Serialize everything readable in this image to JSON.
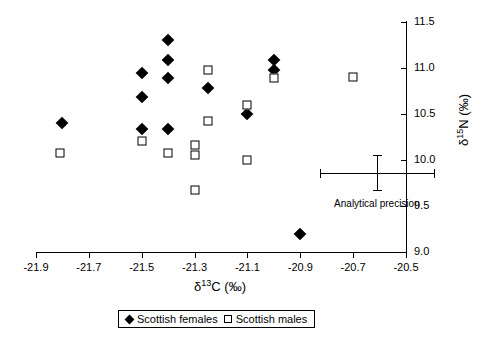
{
  "chart_data": {
    "type": "scatter",
    "title": "",
    "xlabel": "δ¹³C (‰)",
    "ylabel": "δ¹⁵N (‰)",
    "xlabel_parts": {
      "delta": "δ",
      "sup": "13",
      "rest": "C (‰)"
    },
    "ylabel_parts": {
      "delta": "δ",
      "sup": "15",
      "rest": "N (‰)"
    },
    "xlim": [
      -21.9,
      -20.5
    ],
    "ylim": [
      9.0,
      11.5
    ],
    "xticks": [
      -21.9,
      -21.7,
      -21.5,
      -21.3,
      -21.1,
      -20.9,
      -20.7,
      -20.5
    ],
    "yticks": [
      9.0,
      9.5,
      10.0,
      10.5,
      11.0,
      11.5
    ],
    "xtick_labels": [
      "-21.9",
      "-21.7",
      "-21.5",
      "-21.3",
      "-21.1",
      "-20.9",
      "-20.7",
      "-20.5"
    ],
    "ytick_labels": [
      "9.0",
      "9.5",
      "10.0",
      "10.5",
      "11.0",
      "11.5"
    ],
    "y_axis_position": "right",
    "grid": false,
    "legend_position": "below-axis",
    "series": [
      {
        "name": "Scottish females",
        "marker": "filled-diamond",
        "color": "#000000",
        "points": [
          [
            -21.8,
            10.4
          ],
          [
            -21.5,
            10.95
          ],
          [
            -21.5,
            10.68
          ],
          [
            -21.5,
            10.34
          ],
          [
            -21.4,
            11.3
          ],
          [
            -21.4,
            11.09
          ],
          [
            -21.4,
            10.89
          ],
          [
            -21.4,
            10.34
          ],
          [
            -21.25,
            10.78
          ],
          [
            -21.1,
            10.5
          ],
          [
            -21.0,
            11.09
          ],
          [
            -21.0,
            10.98
          ],
          [
            -20.9,
            9.2
          ]
        ]
      },
      {
        "name": "Scottish males",
        "marker": "open-square",
        "color": "#000000",
        "points": [
          [
            -21.81,
            10.08
          ],
          [
            -21.5,
            10.21
          ],
          [
            -21.4,
            10.08
          ],
          [
            -21.3,
            10.16
          ],
          [
            -21.3,
            10.05
          ],
          [
            -21.3,
            9.67
          ],
          [
            -21.25,
            10.98
          ],
          [
            -21.25,
            10.42
          ],
          [
            -21.1,
            10.6
          ],
          [
            -21.1,
            10.0
          ],
          [
            -21.0,
            10.89
          ],
          [
            -20.7,
            10.9
          ]
        ]
      }
    ],
    "annotations": [
      {
        "name": "analytical-precision",
        "label": "Analytical precision",
        "type": "error-cross",
        "x": -20.61,
        "y": 9.86,
        "xerr": 0.215,
        "yerr": 0.19
      }
    ]
  },
  "legend": {
    "entries": [
      {
        "label": "Scottish females",
        "marker": "filled-diamond"
      },
      {
        "label": "Scottish males",
        "marker": "open-square"
      }
    ]
  }
}
